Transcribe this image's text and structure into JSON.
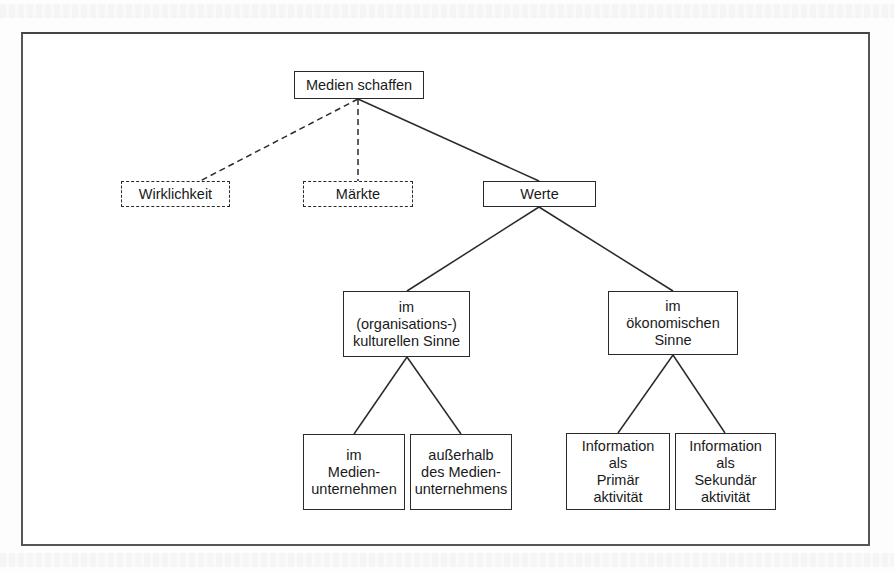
{
  "diagram": {
    "root": {
      "id": "medien-schaffen",
      "lines": [
        "Medien schaffen"
      ]
    },
    "level1": [
      {
        "id": "wirklichkeit",
        "lines": [
          "Wirklichkeit"
        ],
        "style": "dashed"
      },
      {
        "id": "maerkte",
        "lines": [
          "Märkte"
        ],
        "style": "dashed"
      },
      {
        "id": "werte",
        "lines": [
          "Werte"
        ],
        "style": "solid"
      }
    ],
    "level2": [
      {
        "id": "kulturell",
        "lines": [
          "im",
          "(organisations-)",
          "kulturellen Sinne"
        ]
      },
      {
        "id": "oekonomisch",
        "lines": [
          "im",
          "ökonomischen",
          "Sinne"
        ]
      }
    ],
    "level3": [
      {
        "id": "im-medienunternehmen",
        "lines": [
          "im",
          "Medien-",
          "unternehmen"
        ]
      },
      {
        "id": "ausserhalb-medienunternehmen",
        "lines": [
          "außerhalb",
          "des Medien-",
          "unternehmens"
        ]
      },
      {
        "id": "primaeraktivitaet",
        "lines": [
          "Information",
          "als",
          "Primär",
          "aktivität"
        ]
      },
      {
        "id": "sekundaeraktivitaet",
        "lines": [
          "Information",
          "als",
          "Sekundär",
          "aktivität"
        ]
      }
    ],
    "edges": [
      {
        "from": "medien-schaffen",
        "to": "wirklichkeit",
        "style": "dashed"
      },
      {
        "from": "medien-schaffen",
        "to": "maerkte",
        "style": "dashed"
      },
      {
        "from": "medien-schaffen",
        "to": "werte",
        "style": "solid"
      },
      {
        "from": "werte",
        "to": "kulturell",
        "style": "solid"
      },
      {
        "from": "werte",
        "to": "oekonomisch",
        "style": "solid"
      },
      {
        "from": "kulturell",
        "to": "im-medienunternehmen",
        "style": "solid"
      },
      {
        "from": "kulturell",
        "to": "ausserhalb-medienunternehmen",
        "style": "solid"
      },
      {
        "from": "oekonomisch",
        "to": "primaeraktivitaet",
        "style": "solid"
      },
      {
        "from": "oekonomisch",
        "to": "sekundaeraktivitaet",
        "style": "solid"
      }
    ]
  }
}
